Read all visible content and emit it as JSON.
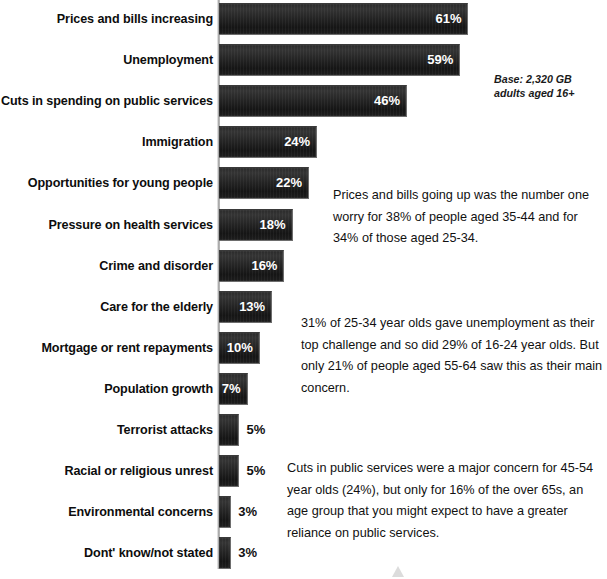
{
  "chart_data": {
    "type": "bar",
    "orientation": "horizontal",
    "title": "",
    "xlabel": "",
    "ylabel": "",
    "xlim": [
      0,
      65
    ],
    "grid": false,
    "legend": null,
    "value_suffix": "%",
    "categories": [
      "Prices and bills increasing",
      "Unemployment",
      "Cuts in spending on public services",
      "Immigration",
      "Opportunities for young people",
      "Pressure on health services",
      "Crime and disorder",
      "Care for the elderly",
      "Mortgage or rent repayments",
      "Population growth",
      "Terrorist attacks",
      "Racial or religious unrest",
      "Environmental concerns",
      "Dont' know/not stated"
    ],
    "values": [
      61,
      59,
      46,
      24,
      22,
      18,
      16,
      13,
      10,
      7,
      5,
      5,
      3,
      3
    ],
    "labels": [
      "61%",
      "59%",
      "46%",
      "24%",
      "22%",
      "18%",
      "16%",
      "13%",
      "10%",
      "7%",
      "5%",
      "5%",
      "3%",
      "3%"
    ],
    "bar_color": "#222222",
    "label_color": "#ffffff"
  },
  "base_note": "Base: 2,320 GB adults aged 16+",
  "notes": [
    "Prices and bills going up was the number one worry for 38% of people aged 35-44 and for 34% of those aged 25-34.",
    "31% of 25-34 year olds gave unemployment as their top challenge and so did 29% of 16-24 year olds. But only 21% of people aged 55-64 saw this as their main concern.",
    "Cuts in public services were a major concern for 45-54 year olds (24%), but only for 16% of the over 65s, an age group that you might expect to have a greater reliance on public services."
  ],
  "footer": {
    "logo_word": ""
  }
}
